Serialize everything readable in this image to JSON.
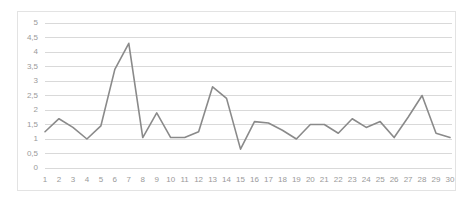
{
  "chart_data": {
    "type": "line",
    "title": "",
    "subtitle": "",
    "xlabel": "",
    "ylabel": "",
    "categories": [
      "1",
      "2",
      "3",
      "4",
      "5",
      "6",
      "7",
      "8",
      "9",
      "10",
      "11",
      "12",
      "13",
      "14",
      "15",
      "16",
      "17",
      "18",
      "19",
      "20",
      "21",
      "22",
      "23",
      "24",
      "25",
      "26",
      "27",
      "28",
      "29",
      "30"
    ],
    "values": [
      1.25,
      1.7,
      1.4,
      1.0,
      1.45,
      3.4,
      4.3,
      1.05,
      1.9,
      1.05,
      1.05,
      1.25,
      2.8,
      2.4,
      0.65,
      1.6,
      1.55,
      1.3,
      1.0,
      1.5,
      1.5,
      1.2,
      1.7,
      1.4,
      1.6,
      1.05,
      1.75,
      2.5,
      1.2,
      1.05
    ],
    "series": [
      {
        "name": "",
        "values": [
          1.25,
          1.7,
          1.4,
          1.0,
          1.45,
          3.4,
          4.3,
          1.05,
          1.9,
          1.05,
          1.05,
          1.25,
          2.8,
          2.4,
          0.65,
          1.6,
          1.55,
          1.3,
          1.0,
          1.5,
          1.5,
          1.2,
          1.7,
          1.4,
          1.6,
          1.05,
          1.75,
          2.5,
          1.2,
          1.05
        ],
        "color": "#8a8a8a"
      }
    ],
    "ylim": [
      0,
      5
    ],
    "y_ticks": [
      0,
      0.5,
      1,
      1.5,
      2,
      2.5,
      3,
      3.5,
      4,
      4.5,
      5
    ],
    "y_tick_labels": [
      "0",
      "0,5",
      "1",
      "1,5",
      "2",
      "2,5",
      "3",
      "3,5",
      "4",
      "4,5",
      "5"
    ],
    "x_tick_labels": [
      "1",
      "2",
      "3",
      "4",
      "5",
      "6",
      "7",
      "8",
      "9",
      "10",
      "11",
      "12",
      "13",
      "14",
      "15",
      "16",
      "17",
      "18",
      "19",
      "20",
      "21",
      "22",
      "23",
      "24",
      "25",
      "26",
      "27",
      "28",
      "29",
      "30"
    ],
    "grid": {
      "horizontal": true,
      "vertical": false,
      "color": "#d9d9d9"
    },
    "legend": {
      "visible": false,
      "position": "none",
      "entries": []
    },
    "colors": {
      "line": "#8a8a8a",
      "gridline": "#d9d9d9",
      "axis_text": "#9a9a9a",
      "border": "#e3e3e3",
      "background": "#ffffff"
    }
  }
}
